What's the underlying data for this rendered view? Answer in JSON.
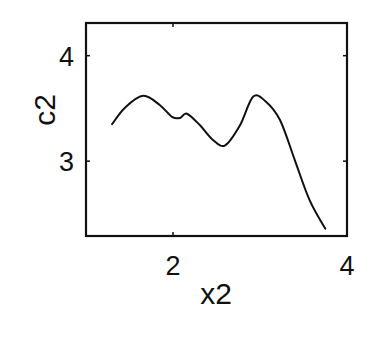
{
  "chart_data": {
    "type": "line",
    "title": "",
    "xlabel": "x2",
    "ylabel": "c2",
    "xlim": [
      1,
      4
    ],
    "ylim": [
      2.29,
      4.31
    ],
    "xticks": [
      2,
      4
    ],
    "yticks": [
      3,
      4
    ],
    "xtick_labels": [
      "2",
      "4"
    ],
    "ytick_labels": [
      "3",
      "4"
    ],
    "grid": false,
    "legend": null,
    "series": [
      {
        "name": "c2",
        "color": "#111111",
        "x": [
          1.3,
          1.45,
          1.66,
          1.85,
          1.99,
          2.08,
          2.16,
          2.31,
          2.46,
          2.6,
          2.77,
          2.92,
          3.06,
          3.23,
          3.4,
          3.57,
          3.75
        ],
        "y": [
          3.35,
          3.51,
          3.62,
          3.53,
          3.42,
          3.41,
          3.45,
          3.34,
          3.2,
          3.15,
          3.34,
          3.61,
          3.57,
          3.39,
          3.01,
          2.63,
          2.36
        ]
      }
    ]
  },
  "layout": {
    "plot_box": {
      "left": 86,
      "top": 23,
      "right": 347,
      "bottom": 236
    }
  }
}
